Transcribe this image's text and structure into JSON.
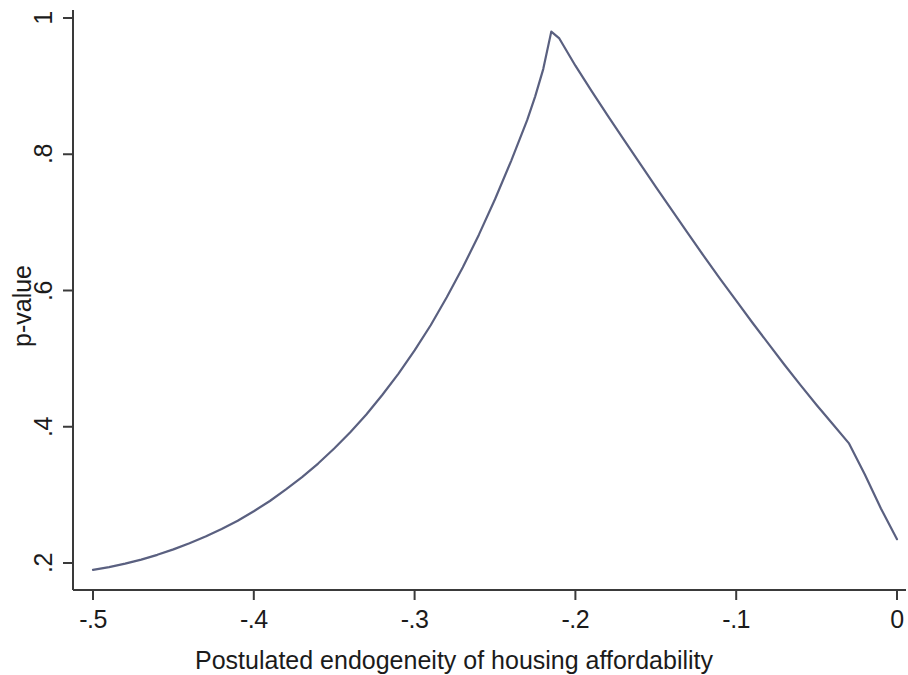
{
  "chart_data": {
    "type": "line",
    "title": "",
    "subtitle": "",
    "xlabel": "Postulated endogeneity of housing affordability",
    "ylabel": "p-value",
    "xlim": [
      -0.5,
      0
    ],
    "ylim": [
      0.16,
      1.02
    ],
    "xticks": [
      -0.5,
      -0.4,
      -0.3,
      -0.2,
      -0.1,
      0
    ],
    "xtick_labels": [
      "-.5",
      "-.4",
      "-.3",
      "-.2",
      "-.1",
      "0"
    ],
    "yticks": [
      0.2,
      0.4,
      0.6,
      0.8,
      1
    ],
    "ytick_labels": [
      ".2",
      ".4",
      ".6",
      ".8",
      "1"
    ],
    "grid": false,
    "legend": null,
    "legend_position": "none",
    "line_color": "#5a6080",
    "line_width": 2.2,
    "axis_color": "#3a3a3a",
    "background_color": "#ffffff",
    "annotations": [],
    "series": [
      {
        "name": "p-value",
        "x": [
          -0.5,
          -0.49,
          -0.48,
          -0.47,
          -0.46,
          -0.45,
          -0.44,
          -0.43,
          -0.42,
          -0.41,
          -0.4,
          -0.39,
          -0.38,
          -0.37,
          -0.36,
          -0.35,
          -0.34,
          -0.33,
          -0.32,
          -0.31,
          -0.3,
          -0.29,
          -0.28,
          -0.27,
          -0.26,
          -0.25,
          -0.24,
          -0.23,
          -0.225,
          -0.22,
          -0.215,
          -0.21,
          -0.2,
          -0.19,
          -0.18,
          -0.17,
          -0.16,
          -0.15,
          -0.14,
          -0.13,
          -0.12,
          -0.11,
          -0.1,
          -0.09,
          -0.08,
          -0.07,
          -0.06,
          -0.05,
          -0.04,
          -0.03,
          -0.02,
          -0.01,
          0
        ],
        "y": [
          0.19,
          0.194,
          0.199,
          0.205,
          0.212,
          0.22,
          0.229,
          0.239,
          0.25,
          0.262,
          0.276,
          0.291,
          0.308,
          0.326,
          0.346,
          0.368,
          0.392,
          0.418,
          0.447,
          0.478,
          0.512,
          0.549,
          0.59,
          0.634,
          0.682,
          0.734,
          0.79,
          0.85,
          0.885,
          0.925,
          0.98,
          0.97,
          0.93,
          0.893,
          0.857,
          0.822,
          0.787,
          0.752,
          0.718,
          0.684,
          0.65,
          0.617,
          0.585,
          0.553,
          0.522,
          0.491,
          0.461,
          0.432,
          0.404,
          0.376,
          0.33,
          0.28,
          0.235
        ]
      }
    ]
  },
  "axes": {
    "x_title": "Postulated endogeneity of housing affordability",
    "y_title": "p-value",
    "x_tick_labels": [
      "-.5",
      "-.4",
      "-.3",
      "-.2",
      "-.1",
      "0"
    ],
    "y_tick_labels": [
      ".2",
      ".4",
      ".6",
      ".8",
      "1"
    ]
  }
}
